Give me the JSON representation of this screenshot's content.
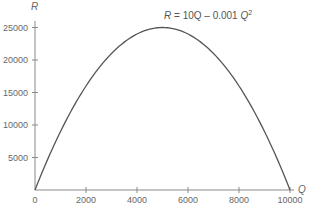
{
  "chart_data": {
    "type": "line",
    "title": "",
    "xlabel": "Q",
    "ylabel": "R",
    "annotation": {
      "prefix": "R",
      "middle": " = 10Q – 0.001 ",
      "var": "Q",
      "exp": "2"
    },
    "function": "R = 10Q - 0.001Q^2",
    "xlim": [
      0,
      10000
    ],
    "ylim": [
      0,
      25000
    ],
    "x_ticks": [
      0,
      2000,
      4000,
      6000,
      8000,
      10000
    ],
    "x_tick_labels": [
      "0",
      "2000",
      "4000",
      "6000",
      "8000",
      "10000"
    ],
    "y_ticks": [
      5000,
      10000,
      15000,
      20000,
      25000
    ],
    "y_tick_labels": [
      "5000",
      "10000",
      "15000",
      "20000",
      "25000"
    ],
    "grid": false,
    "legend": null,
    "series": [
      {
        "name": "R = 10Q - 0.001Q^2",
        "x": [
          0,
          1000,
          2000,
          3000,
          4000,
          5000,
          6000,
          7000,
          8000,
          9000,
          10000
        ],
        "values": [
          0,
          9000,
          16000,
          21000,
          24000,
          25000,
          24000,
          21000,
          16000,
          9000,
          0
        ]
      }
    ],
    "colors": {
      "curve": "#555555",
      "axis": "#8a8a8a",
      "text": "#666666"
    }
  }
}
